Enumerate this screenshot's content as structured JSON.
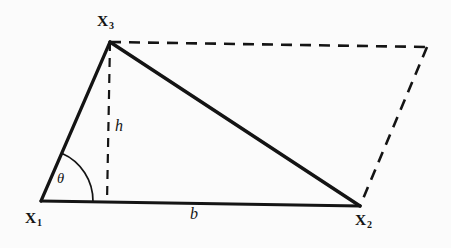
{
  "figure": {
    "name": "triangle-area-parallelogram-diagram",
    "background_color": "#fbfbfb",
    "stroke_color": "#141414",
    "labels": {
      "vertex1": {
        "base": "X",
        "subscript": "1"
      },
      "vertex2": {
        "base": "X",
        "subscript": "2"
      },
      "vertex3": {
        "base": "X",
        "subscript": "3"
      },
      "height": "h",
      "base_side": "b",
      "angle": "θ"
    }
  },
  "chart_data": {
    "type": "diagram",
    "title": "",
    "points": {
      "X1": [
        41,
        201
      ],
      "X2": [
        360,
        206
      ],
      "X3": [
        110,
        42
      ],
      "X4": [
        427,
        47
      ],
      "height_foot": [
        107,
        202
      ]
    },
    "solid_edges": [
      {
        "name": "edge-x1-x3",
        "from": "X1",
        "to": "X3"
      },
      {
        "name": "edge-x3-x2",
        "from": "X3",
        "to": "X2"
      },
      {
        "name": "edge-x1-x2",
        "from": "X1",
        "to": "X2"
      }
    ],
    "dashed_edges": [
      {
        "name": "edge-x3-x4",
        "from": "X3",
        "to": "X4"
      },
      {
        "name": "edge-x4-x2",
        "from": "X4",
        "to": "X2"
      },
      {
        "name": "height-line",
        "from": "X3",
        "to": "height_foot"
      }
    ],
    "angle_arc": {
      "name": "theta-arc",
      "center": "X1",
      "radius": 52,
      "from_edge": "edge-x1-x2",
      "to_edge": "edge-x1-x3"
    },
    "annotations": [
      {
        "name": "height-annotation",
        "text": "h",
        "at": [
          118,
          127
        ]
      },
      {
        "name": "base-annotation",
        "text": "b",
        "at": [
          194,
          215
        ]
      },
      {
        "name": "angle-annotation",
        "text": "θ",
        "at": [
          62,
          180
        ]
      }
    ]
  }
}
